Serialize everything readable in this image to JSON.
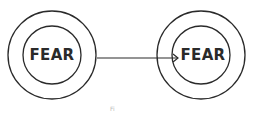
{
  "diagram": {
    "nodes": [
      {
        "id": "left",
        "label": "FEAR",
        "outer_ring": true
      },
      {
        "id": "right",
        "label": "FEAR",
        "outer_ring": true
      }
    ],
    "edges": [
      {
        "from": "left",
        "to": "right",
        "style": "arrow"
      }
    ],
    "caption": "Fi",
    "colors": {
      "stroke": "#2a2a2a",
      "background": "#ffffff"
    }
  }
}
